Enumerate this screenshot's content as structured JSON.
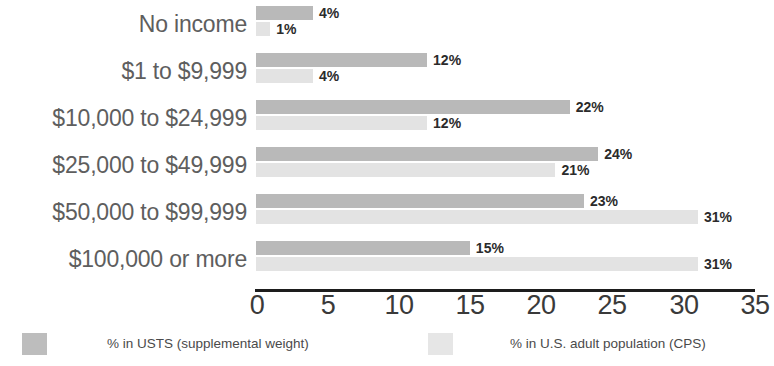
{
  "chart": {
    "title": "",
    "axis": {
      "ticks": [
        "0",
        "5",
        "10",
        "15",
        "20",
        "25",
        "30",
        "35"
      ]
    },
    "legend": {
      "series1_label": "% in USTS (supplemental weight)",
      "series2_label": "% in U.S. adult population (CPS)",
      "series1_color": "#b9b9b9",
      "series2_color": "#e3e3e3"
    },
    "rows": [
      {
        "category": "No income",
        "primary_value": "4%",
        "secondary_value": "1%"
      },
      {
        "category": "$1 to $9,999",
        "primary_value": "12%",
        "secondary_value": "4%"
      },
      {
        "category": "$10,000 to $24,999",
        "primary_value": "22%",
        "secondary_value": "12%"
      },
      {
        "category": "$25,000 to $49,999",
        "primary_value": "24%",
        "secondary_value": "21%"
      },
      {
        "category": "$50,000 to $99,999",
        "primary_value": "23%",
        "secondary_value": "31%"
      },
      {
        "category": "$100,000 or more",
        "primary_value": "15%",
        "secondary_value": "31%"
      }
    ]
  },
  "chart_data": {
    "type": "bar",
    "orientation": "horizontal",
    "title": "",
    "subtitle": "",
    "xlabel": "",
    "ylabel": "",
    "xlim": [
      0,
      35
    ],
    "xticks": [
      0,
      5,
      10,
      15,
      20,
      25,
      30,
      35
    ],
    "grid": false,
    "legend_position": "bottom",
    "categories": [
      "No income",
      "$1 to $9,999",
      "$10,000 to $24,999",
      "$25,000 to $49,999",
      "$50,000 to $99,999",
      "$100,000 or more"
    ],
    "series": [
      {
        "name": "% in USTS (supplemental weight)",
        "color": "#b9b9b9",
        "values": [
          4,
          12,
          22,
          24,
          23,
          15
        ],
        "labels": [
          "4%",
          "12%",
          "22%",
          "24%",
          "23%",
          "15%"
        ]
      },
      {
        "name": "% in U.S. adult population (CPS)",
        "color": "#e3e3e3",
        "values": [
          1,
          4,
          12,
          21,
          31,
          31
        ],
        "labels": [
          "1%",
          "4%",
          "12%",
          "21%",
          "31%",
          "31%"
        ]
      }
    ]
  }
}
